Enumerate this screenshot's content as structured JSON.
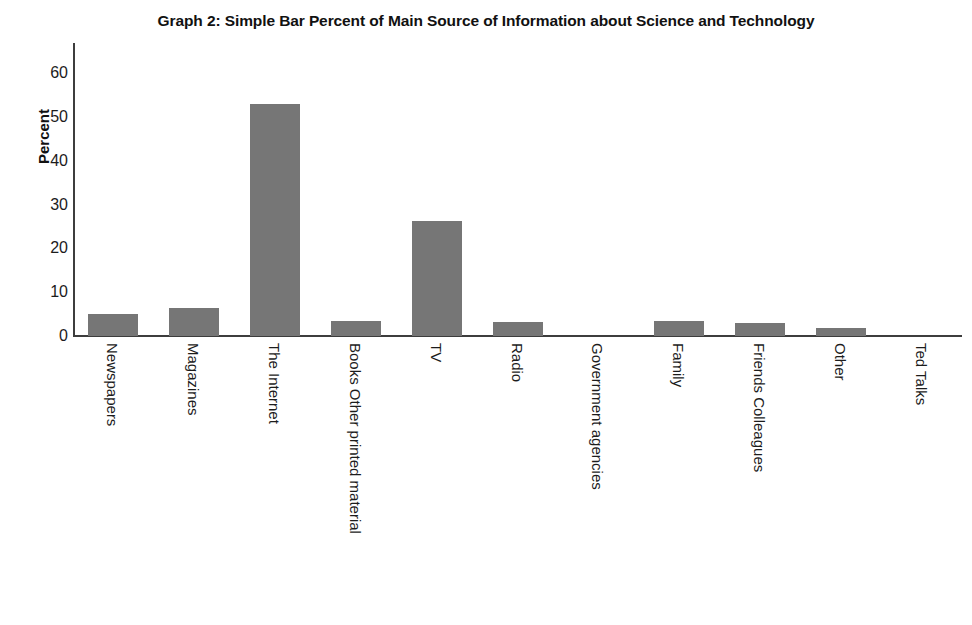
{
  "chart_data": {
    "type": "bar",
    "title": "Graph 2: Simple Bar Percent of Main Source of Information about Science and Technology",
    "xlabel": "",
    "ylabel": "Percent",
    "ylim": [
      0,
      60
    ],
    "yticks": [
      0,
      10,
      20,
      30,
      40,
      50,
      60
    ],
    "grid": false,
    "legend": "none",
    "bar_color": "#767676",
    "axis_color": "#3d3d3d",
    "categories": [
      "Newspapers",
      "Magazines",
      "The Internet",
      "Books Other printed material",
      "TV",
      "Radio",
      "Government agencies",
      "Family",
      "Friends Colleagues",
      "Other",
      "Ted Talks"
    ],
    "values": [
      5.0,
      6.4,
      53.0,
      3.4,
      26.3,
      3.2,
      0.0,
      3.4,
      3.0,
      1.9,
      0.0
    ]
  }
}
